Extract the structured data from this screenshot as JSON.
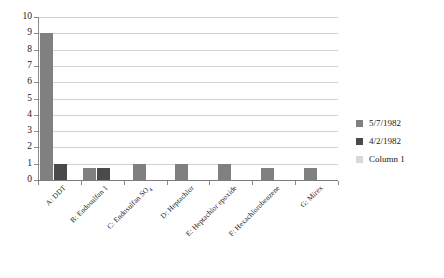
{
  "chart_data": {
    "type": "bar",
    "title": "",
    "subtitle": "",
    "xlabel": "",
    "ylabel": "",
    "ylim": [
      0,
      10
    ],
    "ytick_labels": [
      "0",
      "1",
      "2",
      "3",
      "4",
      "5",
      "6",
      "7",
      "8",
      "9",
      "10"
    ],
    "ytick_values": [
      0,
      1,
      2,
      3,
      4,
      5,
      6,
      7,
      8,
      9,
      10
    ],
    "grid": true,
    "grid_axis": "y",
    "legend_position": "right",
    "categories": [
      "A: DDT",
      "B: Endosulfan 1",
      "C: Endosulfan SO4",
      "D: Heptachlor",
      "E: Heptachlor epoxide",
      "F: Hexachlorobenzene",
      "G: Mirex"
    ],
    "category_labels_html": [
      "A: DDT",
      "B: Endosulfan 1",
      "C: Endosulfan SO<span class=\"sub\">4</span>",
      "D: Heptachlor",
      "E: Heptachlor epoxide",
      "F: Hexachlorobenzene",
      "G: Mirex"
    ],
    "series": [
      {
        "name": "5/7/1982",
        "color": "#808080",
        "values": [
          9,
          0.75,
          1,
          1,
          1,
          0.75,
          0.75
        ]
      },
      {
        "name": "4/2/1982",
        "color": "#4a4a4a",
        "values": [
          1,
          0.75,
          0,
          0,
          0,
          0,
          0
        ]
      },
      {
        "name": "Column 1",
        "color": "#d9d9d9",
        "values": [
          0,
          0,
          0,
          0,
          0,
          0,
          0
        ]
      }
    ]
  },
  "legend": {
    "items": [
      {
        "label": "5/7/1982",
        "color": "#808080"
      },
      {
        "label": "4/2/1982",
        "color": "#4a4a4a"
      },
      {
        "label": "Column 1",
        "color": "#d9d9d9"
      }
    ]
  },
  "axis": {
    "y_max_label": "10",
    "y_min_label": "0"
  }
}
